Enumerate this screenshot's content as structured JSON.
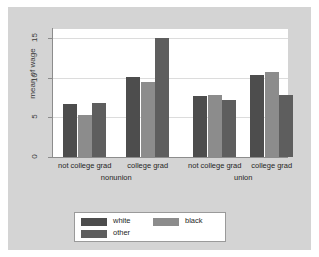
{
  "chart_data": {
    "type": "bar",
    "title": "",
    "xlabel": "",
    "ylabel": "mean of wage",
    "ylim": [
      0,
      16.2
    ],
    "yticks": [
      0,
      5,
      10,
      15
    ],
    "ytick_labels": [
      "0",
      "5",
      "10",
      "15"
    ],
    "grid": true,
    "legend_position": "bottom",
    "outer_groups": [
      "nonunion",
      "union"
    ],
    "categories": [
      "not college grad",
      "college grad",
      "not college grad",
      "college grad"
    ],
    "series": [
      {
        "name": "white",
        "color": "#4d4d4d",
        "values": [
          6.7,
          10.1,
          7.7,
          10.4
        ]
      },
      {
        "name": "black",
        "color": "#8c8c8c",
        "values": [
          5.3,
          9.5,
          7.9,
          10.7
        ]
      },
      {
        "name": "other",
        "color": "#5e5e5e",
        "values": [
          6.8,
          15.1,
          7.2,
          7.9
        ]
      }
    ]
  },
  "axis": {
    "y_title": "mean of wage",
    "ticks": [
      "0",
      "5",
      "10",
      "15"
    ]
  },
  "groups": [
    {
      "label": "not college grad",
      "super": "nonunion"
    },
    {
      "label": "college grad",
      "super": "nonunion"
    },
    {
      "label": "not college grad",
      "super": "union"
    },
    {
      "label": "college grad",
      "super": "union"
    }
  ],
  "supergroups": [
    "nonunion",
    "union"
  ],
  "legend": {
    "entries": [
      {
        "label": "white",
        "color": "#4d4d4d"
      },
      {
        "label": "black",
        "color": "#8c8c8c"
      },
      {
        "label": "other",
        "color": "#5e5e5e"
      }
    ]
  },
  "colors": {
    "figure_background": "#d4d4d4",
    "plot_background": "#ffffff",
    "axis": "#8c8c8c",
    "gridline": "#dcdcdc",
    "text": "#262626"
  }
}
